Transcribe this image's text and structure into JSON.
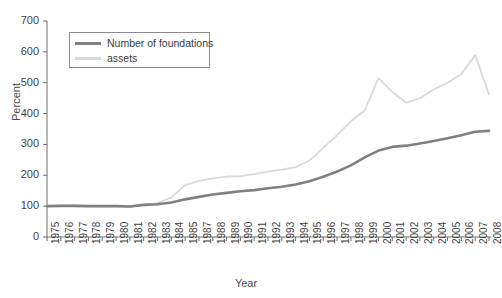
{
  "chart_data": {
    "type": "line",
    "title": "",
    "xlabel": "Year",
    "ylabel": "Percent",
    "ylim": [
      0,
      700
    ],
    "ytick_values": [
      0,
      100,
      200,
      300,
      400,
      500,
      600,
      700
    ],
    "grid": false,
    "legend_position": "top-left",
    "x": [
      1975,
      1976,
      1977,
      1978,
      1979,
      1980,
      1981,
      1982,
      1983,
      1984,
      1985,
      1987,
      1988,
      1989,
      1990,
      1991,
      1992,
      1993,
      1994,
      1995,
      1996,
      1997,
      1998,
      1999,
      2000,
      2001,
      2002,
      2003,
      2004,
      2005,
      2006,
      2007,
      2008
    ],
    "xtick_labels": [
      "1975",
      "1976",
      "1977",
      "1978",
      "1979",
      "1980",
      "1981",
      "1982",
      "1983",
      "1984",
      "1985",
      "1987",
      "1988",
      "1989",
      "1990",
      "1991",
      "1992",
      "1993",
      "1994",
      "1995",
      "1996",
      "1997",
      "1998",
      "1999",
      "2000",
      "2001",
      "2002",
      "2003",
      "2004",
      "2005",
      "2006",
      "2007",
      "2008"
    ],
    "series": [
      {
        "name": "Number of foundations",
        "color": "#808080",
        "values": [
          100,
          101,
          101,
          100,
          100,
          100,
          99,
          104,
          106,
          112,
          122,
          130,
          138,
          143,
          148,
          152,
          158,
          163,
          170,
          181,
          195,
          212,
          232,
          258,
          280,
          292,
          296,
          303,
          311,
          320,
          330,
          341,
          344
        ]
      },
      {
        "name": "assets",
        "color": "#d9d9d9",
        "values": [
          100,
          102,
          103,
          100,
          99,
          100,
          98,
          104,
          110,
          128,
          168,
          182,
          190,
          196,
          197,
          204,
          212,
          218,
          226,
          248,
          288,
          330,
          375,
          410,
          515,
          470,
          435,
          450,
          478,
          500,
          528,
          590,
          462
        ]
      }
    ]
  },
  "legend": {
    "items": [
      {
        "label": "Number of foundations",
        "color": "#808080"
      },
      {
        "label": "assets",
        "color": "#d9d9d9"
      }
    ]
  },
  "axes": {
    "y_title": "Percent",
    "x_title": "Year"
  }
}
